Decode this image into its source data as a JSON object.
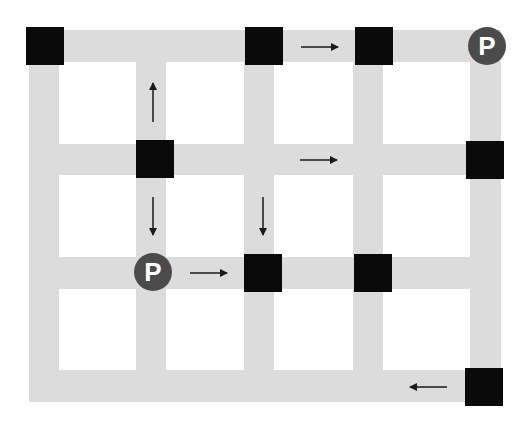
{
  "map": {
    "colors": {
      "background": "#ffffff",
      "road": "#dcdcdc",
      "block": "#0a0a0a",
      "parking_fill": "#4b4b4b",
      "parking_text": "#ffffff",
      "arrow": "#1a1a1a"
    },
    "roads_vertical": [
      {
        "x": 29,
        "y": 30,
        "w": 30,
        "h": 372
      },
      {
        "x": 136,
        "y": 30,
        "w": 30,
        "h": 372
      },
      {
        "x": 244,
        "y": 30,
        "w": 30,
        "h": 372
      },
      {
        "x": 353,
        "y": 30,
        "w": 30,
        "h": 372
      },
      {
        "x": 470,
        "y": 30,
        "w": 31,
        "h": 372
      }
    ],
    "roads_horizontal": [
      {
        "x": 29,
        "y": 30,
        "w": 472,
        "h": 32
      },
      {
        "x": 29,
        "y": 144,
        "w": 472,
        "h": 31
      },
      {
        "x": 29,
        "y": 257,
        "w": 472,
        "h": 32
      },
      {
        "x": 29,
        "y": 370,
        "w": 472,
        "h": 32
      }
    ],
    "blocks": [
      {
        "x": 26,
        "y": 27,
        "size": 38
      },
      {
        "x": 245,
        "y": 27,
        "size": 38
      },
      {
        "x": 355,
        "y": 27,
        "size": 38
      },
      {
        "x": 136,
        "y": 140,
        "size": 38
      },
      {
        "x": 466,
        "y": 141,
        "size": 38
      },
      {
        "x": 244,
        "y": 254,
        "size": 38
      },
      {
        "x": 354,
        "y": 254,
        "size": 38
      },
      {
        "x": 465,
        "y": 368,
        "size": 38
      }
    ],
    "parking": [
      {
        "label": "P",
        "cx": 487,
        "cy": 46,
        "r": 19
      },
      {
        "label": "P",
        "cx": 153,
        "cy": 272,
        "r": 19
      }
    ],
    "arrows": [
      {
        "direction": "up",
        "x1": 153,
        "y1": 122,
        "x2": 153,
        "y2": 83
      },
      {
        "direction": "down",
        "x1": 153,
        "y1": 197,
        "x2": 153,
        "y2": 235
      },
      {
        "direction": "down",
        "x1": 263,
        "y1": 197,
        "x2": 263,
        "y2": 235
      },
      {
        "direction": "right",
        "x1": 301,
        "y1": 47,
        "x2": 338,
        "y2": 47
      },
      {
        "direction": "right",
        "x1": 300,
        "y1": 160,
        "x2": 337,
        "y2": 160
      },
      {
        "direction": "right",
        "x1": 190,
        "y1": 273,
        "x2": 227,
        "y2": 273
      },
      {
        "direction": "left",
        "x1": 447,
        "y1": 387,
        "x2": 410,
        "y2": 387
      }
    ]
  }
}
